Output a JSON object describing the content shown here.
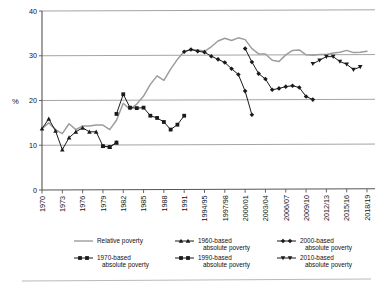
{
  "chart_data": {
    "type": "line",
    "title": "",
    "xlabel": "",
    "ylabel": "%",
    "ylim": [
      0,
      40
    ],
    "yticks": [
      0,
      10,
      20,
      30,
      40
    ],
    "grid": "horizontal",
    "legend_position": "bottom",
    "x": [
      "1970",
      "1971",
      "1972",
      "1973",
      "1974",
      "1975",
      "1976",
      "1977",
      "1978",
      "1979",
      "1980",
      "1981",
      "1982",
      "1983",
      "1984",
      "1985",
      "1986",
      "1987",
      "1988",
      "1989",
      "1990",
      "1991",
      "1992/93",
      "1993/94",
      "1994/95",
      "1995/96",
      "1996/97",
      "1997/98",
      "1998/99",
      "1999/00",
      "2000/01",
      "2001/02",
      "2002/03",
      "2003/04",
      "2004/05",
      "2005/06",
      "2006/07",
      "2007/08",
      "2008/09",
      "2009/10",
      "2010/11",
      "2011/12",
      "2012/13",
      "2013/14",
      "2014/15",
      "2015/16",
      "2016/17",
      "2017/18",
      "2018/19"
    ],
    "xtick_labels": [
      "1970",
      "1973",
      "1976",
      "1979",
      "1982",
      "1985",
      "1988",
      "1991",
      "1994/95",
      "1997/98",
      "2000/01",
      "2003/04",
      "2006/07",
      "2009/10",
      "2012/13",
      "2015/16",
      "2018/19"
    ],
    "series": [
      {
        "name": "Relative poverty",
        "marker": "none",
        "color": "#9d9d9d",
        "points": [
          {
            "x": "1970",
            "y": 13.7
          },
          {
            "x": "1971",
            "y": 15.0
          },
          {
            "x": "1972",
            "y": 13.5
          },
          {
            "x": "1973",
            "y": 12.6
          },
          {
            "x": "1974",
            "y": 14.8
          },
          {
            "x": "1975",
            "y": 13.5
          },
          {
            "x": "1976",
            "y": 14.3
          },
          {
            "x": "1977",
            "y": 14.3
          },
          {
            "x": "1978",
            "y": 14.5
          },
          {
            "x": "1979",
            "y": 14.5
          },
          {
            "x": "1980",
            "y": 13.5
          },
          {
            "x": "1981",
            "y": 15.6
          },
          {
            "x": "1982",
            "y": 19.4
          },
          {
            "x": "1983",
            "y": 18.0
          },
          {
            "x": "1984",
            "y": 19.2
          },
          {
            "x": "1985",
            "y": 21.0
          },
          {
            "x": "1986",
            "y": 23.6
          },
          {
            "x": "1987",
            "y": 25.5
          },
          {
            "x": "1988",
            "y": 24.5
          },
          {
            "x": "1989",
            "y": 27.0
          },
          {
            "x": "1990",
            "y": 29.2
          },
          {
            "x": "1991",
            "y": 30.9
          },
          {
            "x": "1992/93",
            "y": 31.4
          },
          {
            "x": "1993/94",
            "y": 31.3
          },
          {
            "x": "1994/95",
            "y": 31.0
          },
          {
            "x": "1995/96",
            "y": 32.0
          },
          {
            "x": "1996/97",
            "y": 33.3
          },
          {
            "x": "1997/98",
            "y": 33.9
          },
          {
            "x": "1998/99",
            "y": 33.4
          },
          {
            "x": "1999/00",
            "y": 34.0
          },
          {
            "x": "2000/01",
            "y": 33.6
          },
          {
            "x": "2001/02",
            "y": 31.6
          },
          {
            "x": "2002/03",
            "y": 30.4
          },
          {
            "x": "2003/04",
            "y": 30.4
          },
          {
            "x": "2004/05",
            "y": 29.0
          },
          {
            "x": "2005/06",
            "y": 28.7
          },
          {
            "x": "2006/07",
            "y": 30.2
          },
          {
            "x": "2007/08",
            "y": 31.2
          },
          {
            "x": "2008/09",
            "y": 31.3
          },
          {
            "x": "2009/10",
            "y": 30.2
          },
          {
            "x": "2010/11",
            "y": 30.1
          },
          {
            "x": "2011/12",
            "y": 30.3
          },
          {
            "x": "2012/13",
            "y": 30.3
          },
          {
            "x": "2013/14",
            "y": 30.6
          },
          {
            "x": "2014/15",
            "y": 30.8
          },
          {
            "x": "2015/16",
            "y": 31.2
          },
          {
            "x": "2016/17",
            "y": 30.7
          },
          {
            "x": "2017/18",
            "y": 30.8
          },
          {
            "x": "2018/19",
            "y": 31.0
          }
        ]
      },
      {
        "name": "1960-based absolute poverty",
        "marker": "triangle",
        "color": "#1a1a1a",
        "points": [
          {
            "x": "1970",
            "y": 13.7
          },
          {
            "x": "1971",
            "y": 15.9
          },
          {
            "x": "1972",
            "y": 13.2
          },
          {
            "x": "1973",
            "y": 9.0
          },
          {
            "x": "1974",
            "y": 11.7
          },
          {
            "x": "1975",
            "y": 13.0
          },
          {
            "x": "1976",
            "y": 13.9
          },
          {
            "x": "1977",
            "y": 13.0
          },
          {
            "x": "1978",
            "y": 13.0
          },
          {
            "x": "1979",
            "y": 9.8
          },
          {
            "x": "1980",
            "y": 9.6
          },
          {
            "x": "1981",
            "y": 10.6
          }
        ]
      },
      {
        "name": "1970-based absolute poverty",
        "marker": "square",
        "color": "#1a1a1a",
        "points": [
          {
            "x": "1979",
            "y": 9.8
          },
          {
            "x": "1980",
            "y": 9.6
          },
          {
            "x": "1981",
            "y": 10.6
          }
        ]
      },
      {
        "name": "1990-based absolute poverty",
        "marker": "square",
        "color": "#1a1a1a",
        "points": [
          {
            "x": "1981",
            "y": 17.0
          },
          {
            "x": "1982",
            "y": 21.4
          },
          {
            "x": "1983",
            "y": 18.4
          },
          {
            "x": "1984",
            "y": 18.3
          },
          {
            "x": "1985",
            "y": 18.4
          },
          {
            "x": "1986",
            "y": 16.6
          },
          {
            "x": "1987",
            "y": 16.1
          },
          {
            "x": "1988",
            "y": 15.2
          },
          {
            "x": "1989",
            "y": 13.5
          },
          {
            "x": "1990",
            "y": 14.6
          },
          {
            "x": "1991",
            "y": 16.6
          }
        ]
      },
      {
        "name": "2000-based absolute poverty",
        "marker": "diamond",
        "color": "#1a1a1a",
        "points": [
          {
            "x": "1991",
            "y": 30.9
          },
          {
            "x": "1992/93",
            "y": 31.4
          },
          {
            "x": "1993/94",
            "y": 31.0
          },
          {
            "x": "1994/95",
            "y": 30.8
          },
          {
            "x": "1995/96",
            "y": 29.9
          },
          {
            "x": "1996/97",
            "y": 29.2
          },
          {
            "x": "1997/98",
            "y": 28.5
          },
          {
            "x": "1998/99",
            "y": 27.1
          },
          {
            "x": "1999/00",
            "y": 25.8
          },
          {
            "x": "2000/01",
            "y": 22.1
          },
          {
            "x": "2001/02",
            "y": 16.8
          }
        ]
      },
      {
        "name": "2000-based absolute poverty (second branch)",
        "marker": "diamond",
        "color": "#1a1a1a",
        "points": [
          {
            "x": "2000/01",
            "y": 31.6
          },
          {
            "x": "2001/02",
            "y": 28.6
          },
          {
            "x": "2002/03",
            "y": 26.0
          },
          {
            "x": "2003/04",
            "y": 24.8
          },
          {
            "x": "2004/05",
            "y": 22.4
          },
          {
            "x": "2005/06",
            "y": 22.7
          },
          {
            "x": "2006/07",
            "y": 23.1
          },
          {
            "x": "2007/08",
            "y": 23.3
          },
          {
            "x": "2008/09",
            "y": 22.9
          },
          {
            "x": "2009/10",
            "y": 20.9
          },
          {
            "x": "2010/11",
            "y": 20.2
          }
        ]
      },
      {
        "name": "2010-based absolute poverty",
        "marker": "down-triangle",
        "color": "#1a1a1a",
        "points": [
          {
            "x": "2010/11",
            "y": 28.2
          },
          {
            "x": "2011/12",
            "y": 29.0
          },
          {
            "x": "2012/13",
            "y": 29.8
          },
          {
            "x": "2013/14",
            "y": 29.8
          },
          {
            "x": "2014/15",
            "y": 28.7
          },
          {
            "x": "2015/16",
            "y": 28.1
          },
          {
            "x": "2016/17",
            "y": 26.9
          },
          {
            "x": "2017/18",
            "y": 27.5
          }
        ]
      }
    ],
    "legend": [
      {
        "label_line1": "Relative poverty",
        "label_line2": "",
        "marker": "none"
      },
      {
        "label_line1": "1960-based",
        "label_line2": "absolute poverty",
        "marker": "triangle"
      },
      {
        "label_line1": "2000-based",
        "label_line2": "absolute poverty",
        "marker": "diamond"
      },
      {
        "label_line1": "1970-based",
        "label_line2": "absolute poverty",
        "marker": "square"
      },
      {
        "label_line1": "1990-based",
        "label_line2": "absolute poverty",
        "marker": "square"
      },
      {
        "label_line1": "2010-based",
        "label_line2": "absolute poverty",
        "marker": "down-triangle"
      }
    ],
    "colors": {
      "relative": "#9d9d9d",
      "absolute": "#1a1a1a",
      "grid": "#9a9a9a",
      "axis": "#555555"
    }
  }
}
